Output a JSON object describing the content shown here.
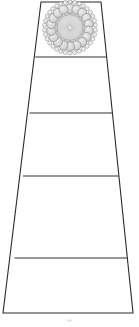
{
  "figure": {
    "title": "Tapered Tiered Panel Elevation",
    "canvas": {
      "width": 139,
      "height": 327
    },
    "background_color": "#ffffff"
  },
  "style": {
    "outline_color": "#2b2b2b",
    "outline_width": 1.1,
    "divider_color": "#333333",
    "divider_width": 1.1,
    "fill_color": "#ffffff",
    "rosette_stroke": "#8c8c8c",
    "rosette_fill": "#d9d9d9",
    "rosette_core_fill": "#e6e6e6",
    "rosette_inner_ring_stroke": "#a8a8a8",
    "rosette_ray_color": "#bdbdbd",
    "smudge_color": "#9a9a9a"
  },
  "geometry": {
    "outline_points": [
      {
        "name": "top-left",
        "x": 41,
        "y": 2
      },
      {
        "name": "top-right",
        "x": 101,
        "y": 2
      },
      {
        "name": "bottom-right",
        "x": 133,
        "y": 313
      },
      {
        "name": "bottom-left",
        "x": 3,
        "y": 313
      }
    ],
    "apex_top_width": 60,
    "base_bottom_width": 130,
    "total_height": 311,
    "taper_ratio": 0.46
  },
  "tiers": [
    {
      "index": 1,
      "name": "rosette-tier",
      "label": "Tier 1",
      "top_y": 2,
      "bottom_y": 57,
      "height": 55,
      "top_left_x": 41,
      "top_right_x": 101,
      "bottom_left_x": 35.3,
      "bottom_right_x": 106.7,
      "has_ornament": true,
      "ornament": "rosette"
    },
    {
      "index": 2,
      "name": "plain-tier-2",
      "label": "Tier 2",
      "top_y": 57,
      "bottom_y": 113,
      "height": 56,
      "top_left_x": 35.3,
      "top_right_x": 106.7,
      "bottom_left_x": 29.5,
      "bottom_right_x": 112.4,
      "has_ornament": false,
      "ornament": null
    },
    {
      "index": 3,
      "name": "plain-tier-3",
      "label": "Tier 3",
      "top_y": 113,
      "bottom_y": 176,
      "height": 63,
      "top_left_x": 29.5,
      "top_right_x": 112.4,
      "bottom_left_x": 22.9,
      "bottom_right_x": 118.9,
      "has_ornament": false,
      "ornament": null
    },
    {
      "index": 4,
      "name": "plain-tier-4",
      "label": "Tier 4",
      "top_y": 176,
      "bottom_y": 258,
      "height": 82,
      "top_left_x": 22.9,
      "top_right_x": 118.9,
      "bottom_left_x": 14.4,
      "bottom_right_x": 127.4,
      "has_ornament": false,
      "ornament": null
    },
    {
      "index": 5,
      "name": "plain-tier-5",
      "label": "Tier 5",
      "top_y": 258,
      "bottom_y": 313,
      "height": 55,
      "top_left_x": 14.4,
      "top_right_x": 127.4,
      "bottom_left_x": 3,
      "bottom_right_x": 133,
      "has_ornament": false,
      "ornament": null
    }
  ],
  "dividers": [
    {
      "name": "divider-1",
      "y": 57,
      "x1": 35.3,
      "x2": 106.7
    },
    {
      "name": "divider-2",
      "y": 113,
      "x1": 29.5,
      "x2": 112.4
    },
    {
      "name": "divider-3",
      "y": 176,
      "x1": 22.9,
      "x2": 118.9
    },
    {
      "name": "divider-4",
      "y": 258,
      "x1": 14.4,
      "x2": 127.4
    }
  ],
  "rosette": {
    "name": "rosette-medallion",
    "center_x": 70,
    "center_y": 27.5,
    "outer_scallop_radius": 25.5,
    "outer_scallop_count": 34,
    "outer_scallop_radius_small": 2.0,
    "petal_ring_radius": 19.0,
    "petal_count": 18,
    "petal_radius": 4.6,
    "inner_ring_radius": 14.2,
    "core_radius": 13.0,
    "ray_count": 40,
    "ray_inner_radius": 1.5,
    "ray_outer_radius": 12.6
  },
  "marks": [
    {
      "name": "baseline-smudge",
      "x": 66,
      "y": 320,
      "width": 7,
      "height": 3
    }
  ]
}
